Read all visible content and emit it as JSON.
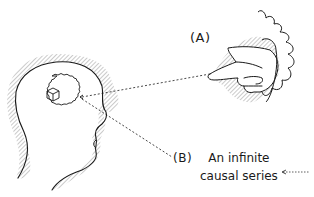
{
  "diagram": {
    "labels": {
      "a": "(A)",
      "b": "(B)"
    },
    "caption": {
      "line1": "An infinite",
      "line2": "causal series"
    },
    "elements": {
      "head": "head-in-profile",
      "thought": "cloud-thought-bubble",
      "object": "cube-icon",
      "hand": "pointing-hand",
      "arrow": "dotted-arrow-left"
    },
    "colors": {
      "ink": "#1a1a1a",
      "hatch": "#8a8a8a",
      "background": "#ffffff"
    }
  }
}
